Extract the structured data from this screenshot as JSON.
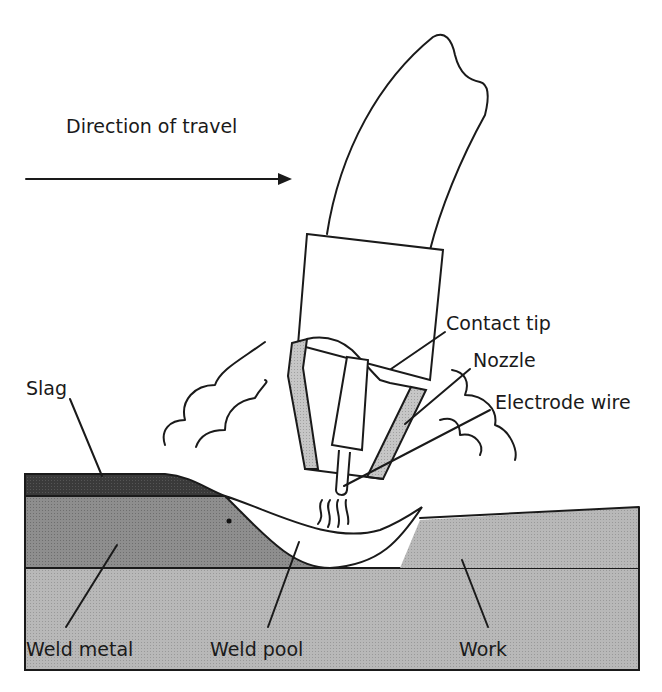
{
  "diagram": {
    "direction_label": "Direction of travel",
    "labels": {
      "contact_tip": "Contact tip",
      "nozzle": "Nozzle",
      "electrode_wire": "Electrode wire",
      "slag": "Slag",
      "weld_metal": "Weld metal",
      "weld_pool": "Weld pool",
      "work": "Work"
    },
    "colors": {
      "slag": "#333333",
      "weld_metal": "#8a8a8a",
      "work": "#b3b3b3",
      "nozzle_fill": "#c0c0c0",
      "line": "#1a1a1a"
    }
  }
}
